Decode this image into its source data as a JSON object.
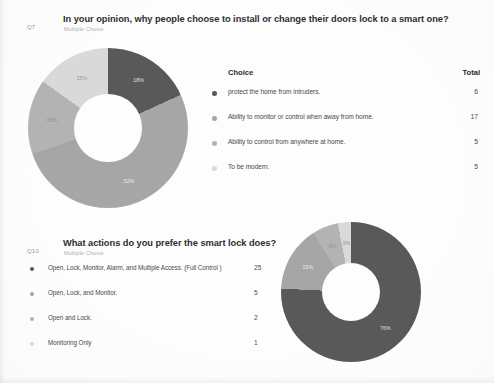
{
  "document": {
    "background_color": "#fdfdfd",
    "text_color": "#3a3a3a"
  },
  "questions": [
    {
      "id": "Q7",
      "title": "In your opinion, why people choose to install or change their doors lock to a smart one?",
      "subtitle": "Multiple Choice",
      "table": {
        "col_choice": "Choice",
        "col_total": "Total"
      },
      "rows": [
        {
          "label": "protect the home from intruders.",
          "total": "6",
          "percent": "18%",
          "color": "#595959"
        },
        {
          "label": "Ability to monitor or control when away from home.",
          "total": "17",
          "percent": "52%",
          "color": "#a6a6a6"
        },
        {
          "label": "Ability to control from anywhere at home.",
          "total": "5",
          "percent": "15%",
          "color": "#b3b3b3"
        },
        {
          "label": "To be modern.",
          "total": "5",
          "percent": "15%",
          "color": "#d9d9d9"
        }
      ]
    },
    {
      "id": "Q10",
      "title": "What actions do you prefer the smart lock does?",
      "subtitle": "Multiple Choice",
      "rows": [
        {
          "label": "Open, Lock, Monitor, Alarm, and Multiple Access. (Full Control )",
          "total": "25",
          "percent": "76%",
          "color": "#595959"
        },
        {
          "label": "Open, Lock, and Monitor.",
          "total": "5",
          "percent": "15%",
          "color": "#a6a6a6"
        },
        {
          "label": "Open and Lock.",
          "total": "2",
          "percent": "6%",
          "color": "#b3b3b3"
        },
        {
          "label": "Monitoring Only",
          "total": "1",
          "percent": "3%",
          "color": "#d9d9d9"
        }
      ]
    }
  ],
  "chart_data": [
    {
      "type": "pie",
      "variant": "donut",
      "title": "In your opinion, why people choose to install or change their doors lock to a smart one?",
      "question_id": "Q7",
      "categories": [
        "protect the home from intruders.",
        "Ability to monitor or control when away from home.",
        "Ability to control from anywhere at home.",
        "To be modern."
      ],
      "values": [
        6,
        17,
        5,
        5
      ],
      "percents": [
        18,
        52,
        15,
        15
      ],
      "total": 33,
      "colors": [
        "#595959",
        "#a6a6a6",
        "#b3b3b3",
        "#d9d9d9"
      ],
      "legend_position": "right",
      "start_angle_deg": 0,
      "hole_ratio": 0.42
    },
    {
      "type": "pie",
      "variant": "donut",
      "title": "What actions do you prefer the smart lock does?",
      "question_id": "Q10",
      "categories": [
        "Open, Lock, Monitor, Alarm, and Multiple Access. (Full Control )",
        "Open, Lock, and Monitor.",
        "Open and Lock.",
        "Monitoring Only"
      ],
      "values": [
        25,
        5,
        2,
        1
      ],
      "percents": [
        76,
        15,
        6,
        3
      ],
      "total": 33,
      "colors": [
        "#595959",
        "#a6a6a6",
        "#b3b3b3",
        "#d9d9d9"
      ],
      "legend_position": "left",
      "start_angle_deg": 0,
      "hole_ratio": 0.42
    }
  ]
}
